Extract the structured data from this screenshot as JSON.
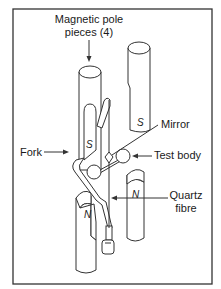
{
  "figure": {
    "type": "torsion balance schematic",
    "colors": {
      "stroke": "#333333",
      "background": "#ffffff",
      "text": "#1a1a1a"
    }
  },
  "labels": {
    "pole_pieces_line1": "Magnetic pole",
    "pole_pieces_line2": "pieces (4)",
    "mirror": "Mirror",
    "fork": "Fork",
    "test_body": "Test body",
    "quartz_line1": "Quartz",
    "quartz_line2": "fibre"
  },
  "poles": {
    "upper_left": "S",
    "upper_right": "S",
    "lower_right": "N",
    "lower_left": "N"
  }
}
